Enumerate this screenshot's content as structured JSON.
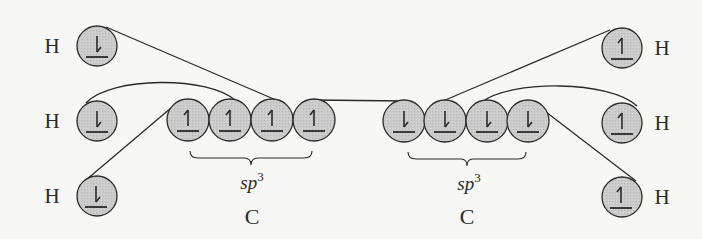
{
  "colors": {
    "background": "#f7f7f5",
    "orbital_fill": "#c9c9c9",
    "stroke": "#2a2a2a"
  },
  "left_group": {
    "hydrogens": [
      {
        "label": "H",
        "spin": "down",
        "cx": 97,
        "cy": 46
      },
      {
        "label": "H",
        "spin": "down",
        "cx": 97,
        "cy": 121
      },
      {
        "label": "H",
        "spin": "down",
        "cx": 97,
        "cy": 196
      }
    ],
    "carbon_orbitals": [
      {
        "spin": "up",
        "cx": 188,
        "cy": 120
      },
      {
        "spin": "up",
        "cx": 230,
        "cy": 120
      },
      {
        "spin": "up",
        "cx": 272,
        "cy": 120
      },
      {
        "spin": "up",
        "cx": 314,
        "cy": 120
      }
    ],
    "hybridization": {
      "base": "sp",
      "sup": "3"
    },
    "atom_label": "C"
  },
  "right_group": {
    "hydrogens": [
      {
        "label": "H",
        "spin": "up",
        "cx": 622,
        "cy": 48
      },
      {
        "label": "H",
        "spin": "up",
        "cx": 622,
        "cy": 123
      },
      {
        "label": "H",
        "spin": "up",
        "cx": 622,
        "cy": 197
      }
    ],
    "carbon_orbitals": [
      {
        "spin": "down",
        "cx": 404,
        "cy": 121
      },
      {
        "spin": "down",
        "cx": 445,
        "cy": 121
      },
      {
        "spin": "down",
        "cx": 487,
        "cy": 121
      },
      {
        "spin": "down",
        "cx": 528,
        "cy": 121
      }
    ],
    "hybridization": {
      "base": "sp",
      "sup": "3"
    },
    "atom_label": "C"
  },
  "bonds": [
    {
      "from": "left_H1",
      "to": "left_C3"
    },
    {
      "from": "left_H2",
      "to": "left_C2"
    },
    {
      "from": "left_H3",
      "to": "left_C1"
    },
    {
      "from": "left_C4",
      "to": "right_C1"
    },
    {
      "from": "right_C2",
      "to": "right_H1"
    },
    {
      "from": "right_C3",
      "to": "right_H2"
    },
    {
      "from": "right_C4",
      "to": "right_H3"
    }
  ]
}
